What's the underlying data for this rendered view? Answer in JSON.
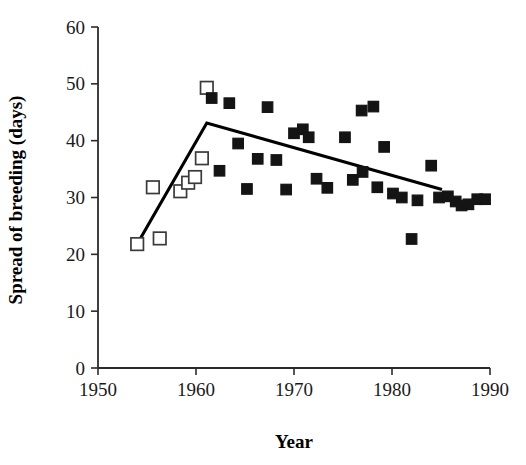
{
  "chart_data": {
    "type": "scatter",
    "title": "",
    "xlabel": "Year",
    "ylabel": "Spread of breeding (days)",
    "xlim": [
      1950,
      1990
    ],
    "ylim": [
      0,
      60
    ],
    "xticks": [
      1950,
      1960,
      1970,
      1980,
      1990
    ],
    "yticks": [
      0,
      10,
      20,
      30,
      40,
      50,
      60
    ],
    "xtick_labels": [
      "1950",
      "1960",
      "1970",
      "1980",
      "1990"
    ],
    "ytick_labels": [
      "0",
      "10",
      "20",
      "30",
      "40",
      "50",
      "60"
    ],
    "grid": false,
    "legend": "none",
    "series": [
      {
        "name": "open-squares",
        "marker": "open-square",
        "points": [
          {
            "x": 1954.0,
            "y": 21.8
          },
          {
            "x": 1955.6,
            "y": 31.8
          },
          {
            "x": 1956.3,
            "y": 22.8
          },
          {
            "x": 1958.4,
            "y": 31.1
          },
          {
            "x": 1959.2,
            "y": 32.6
          },
          {
            "x": 1959.9,
            "y": 33.6
          },
          {
            "x": 1960.6,
            "y": 36.9
          },
          {
            "x": 1961.1,
            "y": 49.3
          }
        ]
      },
      {
        "name": "filled-squares",
        "marker": "filled-square",
        "points": [
          {
            "x": 1961.6,
            "y": 47.5
          },
          {
            "x": 1962.4,
            "y": 34.7
          },
          {
            "x": 1963.4,
            "y": 46.6
          },
          {
            "x": 1964.3,
            "y": 39.5
          },
          {
            "x": 1965.2,
            "y": 31.5
          },
          {
            "x": 1966.3,
            "y": 36.8
          },
          {
            "x": 1967.3,
            "y": 45.9
          },
          {
            "x": 1968.2,
            "y": 36.6
          },
          {
            "x": 1969.2,
            "y": 31.4
          },
          {
            "x": 1970.0,
            "y": 41.3
          },
          {
            "x": 1970.9,
            "y": 42.0
          },
          {
            "x": 1971.5,
            "y": 40.6
          },
          {
            "x": 1972.3,
            "y": 33.3
          },
          {
            "x": 1973.4,
            "y": 31.7
          },
          {
            "x": 1975.2,
            "y": 40.6
          },
          {
            "x": 1976.0,
            "y": 33.1
          },
          {
            "x": 1976.9,
            "y": 45.3
          },
          {
            "x": 1977.0,
            "y": 34.5
          },
          {
            "x": 1978.1,
            "y": 46.0
          },
          {
            "x": 1978.5,
            "y": 31.8
          },
          {
            "x": 1979.2,
            "y": 38.9
          },
          {
            "x": 1980.1,
            "y": 30.7
          },
          {
            "x": 1981.0,
            "y": 30.0
          },
          {
            "x": 1982.0,
            "y": 22.7
          },
          {
            "x": 1982.6,
            "y": 29.5
          },
          {
            "x": 1984.0,
            "y": 35.6
          },
          {
            "x": 1984.8,
            "y": 30.0
          },
          {
            "x": 1985.7,
            "y": 30.2
          },
          {
            "x": 1986.5,
            "y": 29.3
          },
          {
            "x": 1987.1,
            "y": 28.6
          },
          {
            "x": 1987.8,
            "y": 28.8
          },
          {
            "x": 1988.7,
            "y": 29.7
          },
          {
            "x": 1989.5,
            "y": 29.7
          }
        ]
      }
    ],
    "trend_line": {
      "name": "piecewise-regression",
      "style": "solid",
      "vertices": [
        {
          "x": 1954.0,
          "y": 21.8
        },
        {
          "x": 1961.1,
          "y": 43.1
        },
        {
          "x": 1985.1,
          "y": 31.4
        }
      ]
    }
  }
}
